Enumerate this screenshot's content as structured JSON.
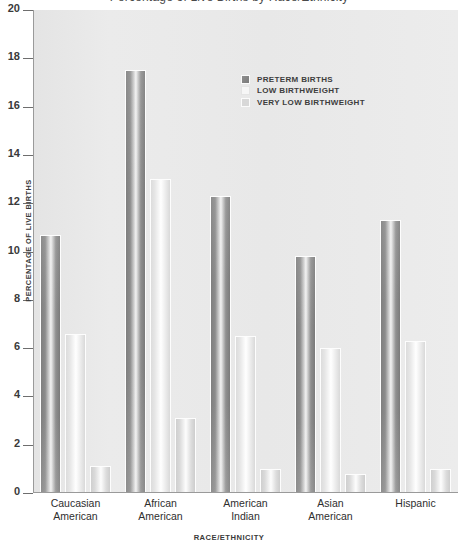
{
  "figure": {
    "title_sliver": "Percentage of Live Births by Race/Ethnicity",
    "background": "#e9e9e9"
  },
  "legend": {
    "position": "inside-top-right",
    "items": [
      {
        "label": "PRETERM BIRTHS",
        "color": "#8a8a8a"
      },
      {
        "label": "LOW BIRTHWEIGHT",
        "color": "#f4f4f4"
      },
      {
        "label": "VERY LOW BIRTHWEIGHT",
        "color": "#d6d6d6"
      }
    ]
  },
  "axes": {
    "y_title": "PERCENTAGE OF LIVE BIRTHS",
    "x_title": "RACE/ETHNICITY",
    "y_ticks": [
      "20",
      "18",
      "16",
      "14",
      "12",
      "10",
      "8",
      "6",
      "4",
      "2",
      "0"
    ]
  },
  "categories_wrapped": [
    [
      "Caucasian",
      "American"
    ],
    [
      "African",
      "American"
    ],
    [
      "American",
      "Indian"
    ],
    [
      "Asian",
      "American"
    ],
    [
      "Hispanic",
      ""
    ]
  ],
  "chart_data": {
    "type": "bar",
    "title": "Percentage of Live Births by Race/Ethnicity",
    "xlabel": "RACE/ETHNICITY",
    "ylabel": "PERCENTAGE OF LIVE BIRTHS",
    "ylim": [
      0,
      20
    ],
    "ytick_step": 2,
    "grid": false,
    "legend_position": "inside-top-right",
    "categories": [
      "Caucasian American",
      "African American",
      "American Indian",
      "Asian American",
      "Hispanic"
    ],
    "series": [
      {
        "name": "PRETERM BIRTHS",
        "color": "#8a8a8a",
        "values": [
          10.7,
          17.5,
          12.3,
          9.8,
          11.3
        ]
      },
      {
        "name": "LOW BIRTHWEIGHT",
        "color": "#f4f4f4",
        "values": [
          6.6,
          13.0,
          6.5,
          6.0,
          6.3
        ]
      },
      {
        "name": "VERY LOW BIRTHWEIGHT",
        "color": "#d6d6d6",
        "values": [
          1.1,
          3.1,
          1.0,
          0.8,
          1.0
        ]
      }
    ]
  }
}
